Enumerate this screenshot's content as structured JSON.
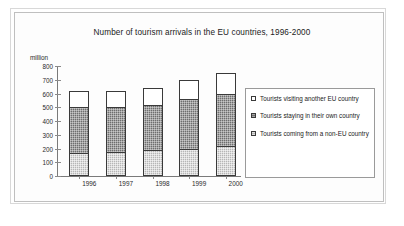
{
  "chart_data": {
    "type": "bar",
    "title": "Number of tourism arrivals in the EU countries, 1996-2000",
    "subtitle": "",
    "xlabel": "",
    "ylabel": "million",
    "ylim": [
      0,
      800
    ],
    "yticks": [
      0,
      100,
      200,
      300,
      400,
      500,
      600,
      700,
      800
    ],
    "ytick_labels": [
      "0",
      "100",
      "200",
      "300",
      "400",
      "500",
      "600",
      "700",
      "800"
    ],
    "categories": [
      "1996",
      "1997",
      "1998",
      "1999",
      "2000"
    ],
    "stacked": true,
    "grid": false,
    "legend_position": "right",
    "series": [
      {
        "name": "Tourists coming from a non-EU country",
        "values": [
          170,
          175,
          190,
          200,
          215
        ],
        "color": "#b6b6b6",
        "pattern": "light-dotted"
      },
      {
        "name": "Tourists staying in their own country",
        "values": [
          330,
          325,
          325,
          360,
          385
        ],
        "color": "#6e6e6e",
        "pattern": "dark-dotted"
      },
      {
        "name": "Tourists visiting another EU country",
        "values": [
          115,
          115,
          125,
          140,
          150
        ],
        "color": "#ffffff",
        "pattern": "solid-white"
      }
    ],
    "stack_totals": [
      615,
      615,
      640,
      700,
      750
    ],
    "annotations": []
  },
  "legend": {
    "items": [
      {
        "label": "Tourists visiting another EU country",
        "swatch_class": "sw-eu"
      },
      {
        "label": "Tourists staying in their own country",
        "swatch_class": "sw-own"
      },
      {
        "label": "Tourists coming from a non-EU country",
        "swatch_class": "sw-nonEU"
      }
    ]
  }
}
